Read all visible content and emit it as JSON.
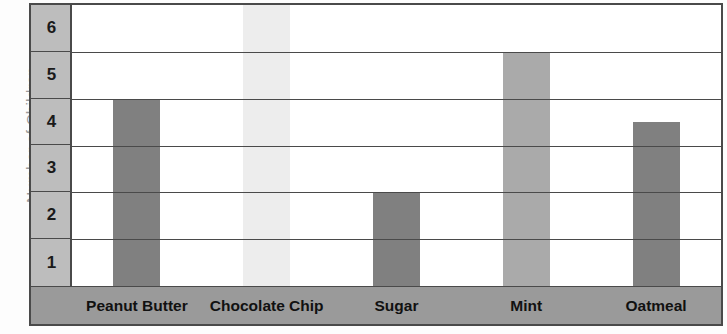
{
  "chart_data": {
    "type": "bar",
    "title": "",
    "xlabel": "",
    "ylabel": "Number of Children",
    "categories": [
      "Peanut Butter",
      "Chocolate Chip",
      "Sugar",
      "Mint",
      "Oatmeal"
    ],
    "values": [
      4,
      6,
      2,
      5,
      3.5
    ],
    "series": [
      {
        "name": "Number of Children",
        "values": [
          4,
          6,
          2,
          5,
          3.5
        ]
      }
    ],
    "ytick_labels": [
      "6",
      "5",
      "4",
      "3",
      "2",
      "1"
    ],
    "ylim": [
      0,
      6
    ],
    "grid": true,
    "legend": "none",
    "bar_colors": [
      "#808080",
      "#ededed",
      "#808080",
      "#aaaaaa",
      "#808080"
    ],
    "colors": {
      "frame": "#4a4a4a",
      "ytick_column_bg": "#bdbdbd",
      "xlabel_strip_bg": "#9a9a9a",
      "plot_bg": "#ffffff",
      "ylabel_text": "#9b9b9b",
      "tick_text": "#1a1a1a",
      "category_text": "#111111"
    }
  },
  "axis": {
    "y_title": "Number of Children",
    "y_ticks": [
      {
        "label": "6"
      },
      {
        "label": "5"
      },
      {
        "label": "4"
      },
      {
        "label": "3"
      },
      {
        "label": "2"
      },
      {
        "label": "1"
      }
    ],
    "x_categories": [
      {
        "label": "Peanut Butter"
      },
      {
        "label": "Chocolate Chip"
      },
      {
        "label": "Sugar"
      },
      {
        "label": "Mint"
      },
      {
        "label": "Oatmeal"
      }
    ]
  }
}
